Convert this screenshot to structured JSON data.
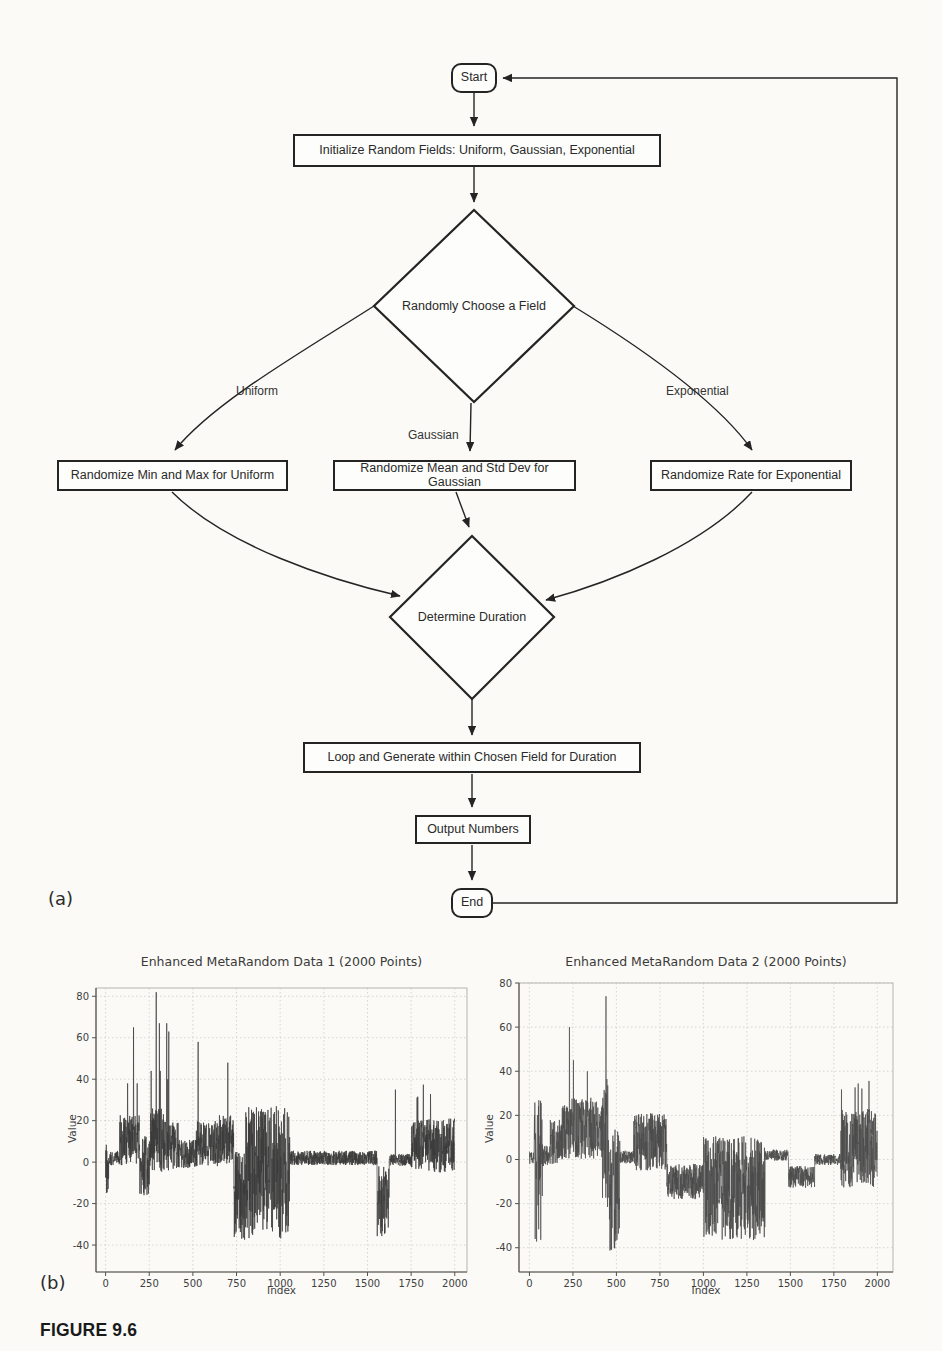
{
  "figure": {
    "panel_a_label": "(a)",
    "panel_b_label": "(b)",
    "caption": "FIGURE 9.6"
  },
  "flowchart": {
    "line_color": "#242424",
    "nodes": {
      "start": "Start",
      "init": "Initialize Random Fields: Uniform, Gaussian, Exponential",
      "choose": "Randomly Choose a Field",
      "uniform_box": "Randomize Min and Max for Uniform",
      "gaussian_box": "Randomize Mean and Std Dev for Gaussian",
      "exponential_box": "Randomize Rate for Exponential",
      "duration": "Determine Duration",
      "loop": "Loop and Generate within Chosen Field for Duration",
      "output": "Output Numbers",
      "end": "End"
    },
    "edge_labels": {
      "uniform": "Uniform",
      "gaussian": "Gaussian",
      "exponential": "Exponential"
    }
  },
  "chart_data": [
    {
      "type": "line",
      "title": "Enhanced MetaRandom Data 1 (2000 Points)",
      "xlabel": "Index",
      "ylabel": "Value",
      "n_points": 2000,
      "xticks": [
        0,
        250,
        500,
        750,
        1000,
        1250,
        1500,
        1750,
        2000
      ],
      "yticks": [
        -40,
        -20,
        0,
        20,
        40,
        60,
        80
      ],
      "xlim": [
        -55,
        2070
      ],
      "ylim": [
        -53,
        84
      ],
      "grid": true,
      "legend": "none",
      "line_color": "#3a3a3a",
      "seed": 20011,
      "segments": [
        [
          0,
          18,
          -3,
          12,
          -19,
          9
        ],
        [
          18,
          80,
          2,
          3.5
        ],
        [
          80,
          195,
          11,
          13,
          -17,
          38,
          0.012,
          40,
          66
        ],
        [
          195,
          258,
          -2,
          15,
          -33,
          36
        ],
        [
          258,
          332,
          10,
          16,
          -20,
          44,
          0.03,
          45,
          70
        ],
        [
          332,
          425,
          8,
          12,
          -19,
          40,
          0.02,
          38,
          64
        ],
        [
          425,
          520,
          4,
          7,
          -13,
          18
        ],
        [
          520,
          645,
          9,
          11,
          -8,
          36,
          0.012,
          38,
          58
        ],
        [
          645,
          735,
          11,
          12,
          -6,
          38,
          0.01,
          40,
          48
        ],
        [
          735,
          800,
          -17,
          22,
          -46,
          12
        ],
        [
          800,
          1055,
          -5,
          32,
          -49,
          41
        ],
        [
          1055,
          1555,
          2,
          3.5
        ],
        [
          1555,
          1625,
          -19,
          17,
          -43,
          3
        ],
        [
          1625,
          1752,
          1,
          3
        ],
        [
          1752,
          2000,
          8,
          13,
          -27,
          40,
          0.012,
          30,
          39
        ]
      ],
      "spikes": [
        [
          160,
          65
        ],
        [
          290,
          82
        ],
        [
          308,
          67
        ],
        [
          350,
          67
        ],
        [
          362,
          63
        ],
        [
          530,
          58
        ],
        [
          700,
          48
        ],
        [
          1660,
          35
        ]
      ]
    },
    {
      "type": "line",
      "title": "Enhanced MetaRandom Data 2 (2000 Points)",
      "xlabel": "Index",
      "ylabel": "Value",
      "n_points": 2000,
      "xticks": [
        0,
        250,
        500,
        750,
        1000,
        1250,
        1500,
        1750,
        2000
      ],
      "yticks": [
        -40,
        -20,
        0,
        20,
        40,
        60,
        80
      ],
      "xlim": [
        -60,
        2090
      ],
      "ylim": [
        -51,
        80
      ],
      "grid": true,
      "legend": "none",
      "line_color": "#4a4a4a",
      "seed": 7309,
      "segments": [
        [
          0,
          28,
          1,
          3
        ],
        [
          28,
          75,
          -5,
          33,
          -42,
          33
        ],
        [
          75,
          120,
          2,
          5
        ],
        [
          120,
          185,
          8,
          10,
          -16,
          28
        ],
        [
          185,
          420,
          14,
          14,
          -12,
          40,
          0.02,
          40,
          57
        ],
        [
          420,
          458,
          8,
          30,
          -32,
          55
        ],
        [
          458,
          520,
          -14,
          28,
          -46,
          33
        ],
        [
          520,
          600,
          1,
          3
        ],
        [
          600,
          790,
          8,
          13,
          -16,
          40,
          0.01,
          36,
          44
        ],
        [
          790,
          1000,
          -10,
          8,
          -23,
          6
        ],
        [
          1000,
          1355,
          -13,
          24,
          -49,
          26
        ],
        [
          1355,
          1490,
          2,
          2.5
        ],
        [
          1490,
          1640,
          -8,
          5
        ],
        [
          1640,
          1790,
          0,
          2.5
        ],
        [
          1790,
          2000,
          5,
          18,
          -33,
          38,
          0.02,
          30,
          38
        ]
      ],
      "spikes": [
        [
          230,
          60
        ],
        [
          253,
          45
        ],
        [
          440,
          74
        ]
      ]
    }
  ]
}
